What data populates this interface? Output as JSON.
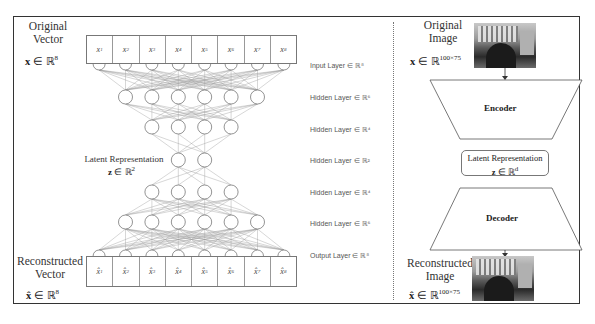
{
  "left_panel": {
    "input": {
      "title_line1": "Original",
      "title_line2": "Vector",
      "math_var": "x",
      "math_in": " ∈ ℝ",
      "math_sup": "8",
      "cells": [
        "x",
        "x",
        "x",
        "x",
        "x",
        "x",
        "x",
        "x"
      ],
      "subs": [
        "1",
        "2",
        "3",
        "4",
        "5",
        "6",
        "7",
        "8"
      ]
    },
    "latent": {
      "title": "Latent Representation",
      "math_var": "z",
      "math_in": " ∈ ℝ",
      "math_sup": "2"
    },
    "output": {
      "title_line1": "Reconstructed",
      "title_line2": "Vector",
      "math_var": "x̂",
      "math_in": " ∈ ℝ",
      "math_sup": "8",
      "cells": [
        "x̂",
        "x̂",
        "x̂",
        "x̂",
        "x̂",
        "x̂",
        "x̂",
        "x̂"
      ],
      "subs": [
        "1",
        "2",
        "3",
        "4",
        "5",
        "6",
        "7",
        "8"
      ]
    },
    "layer_labels": [
      "Input Layer ∈ ℝ⁸",
      "Hidden Layer ∈ ℝ⁶",
      "Hidden Layer ∈ ℝ⁴",
      "Hidden Layer ∈ ℝ²",
      "Hidden Layer ∈ ℝ⁴",
      "Hidden Layer ∈ ℝ⁶",
      "Output Layer ∈ ℝ⁸"
    ],
    "layer_sizes": [
      8,
      6,
      4,
      2,
      4,
      6,
      8
    ]
  },
  "right_panel": {
    "input": {
      "title_line1": "Original",
      "title_line2": "Image",
      "math_var": "x",
      "math_in": " ∈ ℝ",
      "math_sup": "100×75"
    },
    "encoder_label": "Encoder",
    "latent": {
      "title": "Latent Representation",
      "math_var": "z",
      "math_in": " ∈ ℝ",
      "math_sup": "d"
    },
    "decoder_label": "Decoder",
    "output": {
      "title_line1": "Reconstructed",
      "title_line2": "Image",
      "math_var": "x̂",
      "math_in": " ∈ ℝ",
      "math_sup": "100×75"
    }
  }
}
